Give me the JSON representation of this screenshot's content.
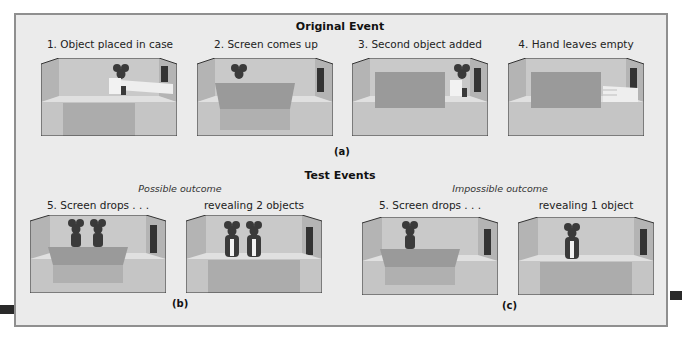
{
  "section_a": {
    "title": "Original Event",
    "label": "(a)",
    "panels": [
      {
        "caption": "1. Object placed in case",
        "scene": "hand places mouse toy on stage, screen down"
      },
      {
        "caption": "2. Screen comes up",
        "scene": "screen raised, one mouse visible behind"
      },
      {
        "caption": "3. Second object added",
        "scene": "hand adds second mouse beside raised screen"
      },
      {
        "caption": "4. Hand leaves empty",
        "scene": "screen raised, empty hand withdraws"
      }
    ]
  },
  "section_test": {
    "title": "Test Events"
  },
  "section_b": {
    "outcome": "Possible outcome",
    "label": "(b)",
    "panels": [
      {
        "caption": "5. Screen drops . . .",
        "scene": "screen lowering, two mice visible"
      },
      {
        "caption": "revealing 2 objects",
        "scene": "two mice on stage"
      }
    ]
  },
  "section_c": {
    "outcome": "Impossible outcome",
    "label": "(c)",
    "panels": [
      {
        "caption": "5. Screen drops . . .",
        "scene": "screen lowering, one mouse visible"
      },
      {
        "caption": "revealing 1 object",
        "scene": "one mouse on stage"
      }
    ]
  },
  "colors": {
    "background": "#ebebeb",
    "frame_border": "#8f8f8f",
    "back_wall": "#c9c9c9",
    "side_wall": "#b4b4b4",
    "floor": "#e0e0e0",
    "front": "#bdbdbd",
    "screen": "#9a9a9a",
    "mouse": "#3a3a3a"
  }
}
